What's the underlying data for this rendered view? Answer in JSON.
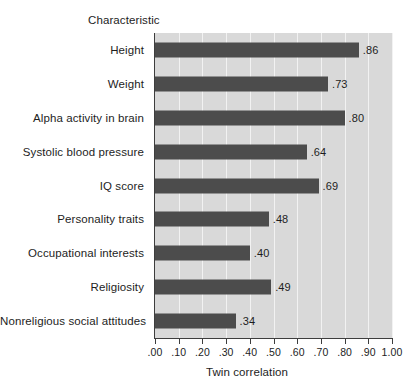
{
  "chart_data": {
    "type": "bar",
    "orientation": "horizontal",
    "title": "Characteristic",
    "xlabel": "Twin correlation",
    "ylabel": "Characteristic",
    "xlim": [
      0.0,
      1.0
    ],
    "xticks": [
      0.0,
      0.1,
      0.2,
      0.3,
      0.4,
      0.5,
      0.6,
      0.7,
      0.8,
      0.9,
      1.0
    ],
    "xticklabels": [
      ".00",
      ".10",
      ".20",
      ".30",
      ".40",
      ".50",
      ".60",
      ".70",
      ".80",
      ".90",
      "1.00"
    ],
    "grid": true,
    "grid_axis": "x",
    "legend": false,
    "categories": [
      "Height",
      "Weight",
      "Alpha activity in brain",
      "Systolic blood pressure",
      "IQ score",
      "Personality traits",
      "Occupational interests",
      "Religiosity",
      "Nonreligious social attitudes"
    ],
    "values": [
      0.86,
      0.73,
      0.8,
      0.64,
      0.69,
      0.48,
      0.4,
      0.49,
      0.34
    ],
    "value_labels": [
      ".86",
      ".73",
      ".80",
      ".64",
      ".69",
      ".48",
      ".40",
      ".49",
      ".34"
    ],
    "colors": {
      "bar": "#4c4c4c",
      "plot_background": "#d9d9d9",
      "gridline": "#f2f2f2",
      "axis": "#3d3d3d",
      "text": "#1d1d1d",
      "page_background": "#ffffff"
    }
  }
}
